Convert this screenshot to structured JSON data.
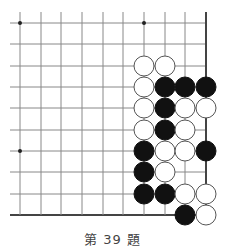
{
  "problem": {
    "caption": "第 39 題",
    "number": 39
  },
  "board": {
    "cols_x": [
      20,
      41,
      61,
      82,
      103,
      123,
      144,
      165,
      185,
      206
    ],
    "rows_y": [
      23,
      44,
      66,
      87,
      108,
      130,
      151,
      172,
      194,
      215
    ],
    "line_color": "#888888",
    "edge_color": "#444444",
    "edges": [
      "right",
      "bottom"
    ],
    "star_points": [
      [
        0,
        0
      ],
      [
        6,
        0
      ],
      [
        0,
        6
      ]
    ],
    "stone_radius": 10,
    "stones": [
      {
        "col": 6,
        "row": 2,
        "color": "white"
      },
      {
        "col": 7,
        "row": 2,
        "color": "white"
      },
      {
        "col": 6,
        "row": 3,
        "color": "white"
      },
      {
        "col": 7,
        "row": 3,
        "color": "black"
      },
      {
        "col": 8,
        "row": 3,
        "color": "black"
      },
      {
        "col": 9,
        "row": 3,
        "color": "black"
      },
      {
        "col": 6,
        "row": 4,
        "color": "white"
      },
      {
        "col": 7,
        "row": 4,
        "color": "black"
      },
      {
        "col": 8,
        "row": 4,
        "color": "white"
      },
      {
        "col": 9,
        "row": 4,
        "color": "white"
      },
      {
        "col": 6,
        "row": 5,
        "color": "white"
      },
      {
        "col": 7,
        "row": 5,
        "color": "black"
      },
      {
        "col": 8,
        "row": 5,
        "color": "white"
      },
      {
        "col": 6,
        "row": 6,
        "color": "black"
      },
      {
        "col": 7,
        "row": 6,
        "color": "white"
      },
      {
        "col": 8,
        "row": 6,
        "color": "white"
      },
      {
        "col": 9,
        "row": 6,
        "color": "black"
      },
      {
        "col": 6,
        "row": 7,
        "color": "black"
      },
      {
        "col": 7,
        "row": 7,
        "color": "white"
      },
      {
        "col": 6,
        "row": 8,
        "color": "black"
      },
      {
        "col": 7,
        "row": 8,
        "color": "black"
      },
      {
        "col": 8,
        "row": 8,
        "color": "white"
      },
      {
        "col": 9,
        "row": 8,
        "color": "white"
      },
      {
        "col": 8,
        "row": 9,
        "color": "black"
      },
      {
        "col": 9,
        "row": 9,
        "color": "white"
      }
    ]
  }
}
